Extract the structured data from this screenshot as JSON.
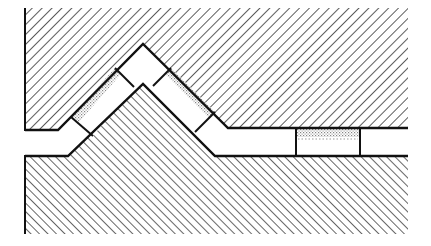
{
  "diagram": {
    "title": "",
    "colors": {
      "background": "#ffffff",
      "line": "#111111",
      "hatch": "#333333",
      "stipple": "#777777"
    },
    "regions": [
      {
        "id": "upper-body",
        "fill": "diagonal-hatch-up"
      },
      {
        "id": "lower-body",
        "fill": "diagonal-hatch-down"
      },
      {
        "id": "channel",
        "fill": "none"
      }
    ],
    "blocks": [
      {
        "id": "left-block",
        "fill": "stipple-partial"
      },
      {
        "id": "apex-block",
        "fill": "none"
      },
      {
        "id": "right-block",
        "fill": "stipple-partial"
      },
      {
        "id": "horizontal-block",
        "fill": "stipple-top"
      }
    ],
    "labels": []
  }
}
